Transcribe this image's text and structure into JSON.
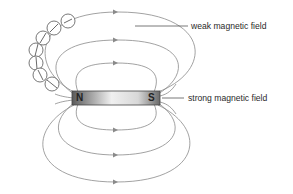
{
  "diagram": {
    "magnet": {
      "north_label": "N",
      "south_label": "S"
    },
    "labels": {
      "weak": "weak magnetic field",
      "strong": "strong magnetic field"
    },
    "compass_count": 8,
    "field_line_color": "#8a8a8a",
    "magnet_gradient": [
      "#5a5a5a",
      "#f2f2f2",
      "#5a5a5a"
    ]
  }
}
